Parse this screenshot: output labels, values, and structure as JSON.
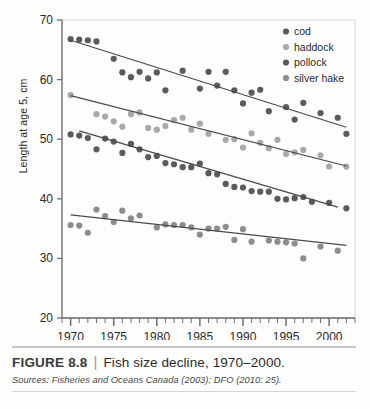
{
  "figure": {
    "number_label": "FIGURE 8.8",
    "separator": "|",
    "title": "Fish size decline, 1970–2000.",
    "sources_label": "Sources:",
    "sources_text": "Fisheries and Oceans Canada (2003); DFO (2010: 25)."
  },
  "chart_data": {
    "type": "scatter",
    "title": "Fish size decline, 1970–2000.",
    "xlabel": "",
    "ylabel": "Length at age 5, cm",
    "xlim": [
      1969,
      2003
    ],
    "ylim": [
      20,
      70
    ],
    "yticks": [
      20,
      30,
      40,
      50,
      60,
      70
    ],
    "xticks": [
      1970,
      1975,
      1980,
      1985,
      1990,
      1995,
      2000
    ],
    "xminor_step": 1,
    "grid": false,
    "legend_position": "top-right",
    "colors": {
      "cod": "#5b5b5e",
      "haddock": "#a9a9ac",
      "pollock": "#5b5b5e",
      "silver_hake": "#8d8d90",
      "trendline": "#4a4a4d",
      "axis": "#6e6e70"
    },
    "series": [
      {
        "name": "cod",
        "color": "#5b5b5e",
        "trend": {
          "x": [
            1970,
            2002
          ],
          "y": [
            66.6,
            52.0
          ]
        },
        "points": [
          {
            "x": 1970,
            "y": 66.8
          },
          {
            "x": 1971,
            "y": 66.7
          },
          {
            "x": 1972,
            "y": 66.6
          },
          {
            "x": 1973,
            "y": 66.4
          },
          {
            "x": 1975,
            "y": 63.5
          },
          {
            "x": 1976,
            "y": 61.2
          },
          {
            "x": 1977,
            "y": 60.4
          },
          {
            "x": 1978,
            "y": 61.3
          },
          {
            "x": 1979,
            "y": 60.2
          },
          {
            "x": 1980,
            "y": 61.2
          },
          {
            "x": 1981,
            "y": 58.2
          },
          {
            "x": 1983,
            "y": 61.5
          },
          {
            "x": 1985,
            "y": 58.5
          },
          {
            "x": 1986,
            "y": 61.3
          },
          {
            "x": 1987,
            "y": 59.0
          },
          {
            "x": 1988,
            "y": 61.3
          },
          {
            "x": 1989,
            "y": 58.2
          },
          {
            "x": 1990,
            "y": 56.0
          },
          {
            "x": 1991,
            "y": 57.8
          },
          {
            "x": 1992,
            "y": 58.3
          },
          {
            "x": 1993,
            "y": 54.7
          },
          {
            "x": 1995,
            "y": 55.4
          },
          {
            "x": 1996,
            "y": 53.3
          },
          {
            "x": 1997,
            "y": 56.1
          },
          {
            "x": 1999,
            "y": 54.4
          },
          {
            "x": 2001,
            "y": 53.6
          },
          {
            "x": 2002,
            "y": 50.9
          }
        ]
      },
      {
        "name": "haddock",
        "color": "#a9a9ac",
        "trend": {
          "x": [
            1970,
            2002
          ],
          "y": [
            57.3,
            45.5
          ]
        },
        "points": [
          {
            "x": 1970,
            "y": 57.4
          },
          {
            "x": 1973,
            "y": 54.2
          },
          {
            "x": 1974,
            "y": 53.8
          },
          {
            "x": 1975,
            "y": 53.0
          },
          {
            "x": 1976,
            "y": 52.1
          },
          {
            "x": 1977,
            "y": 54.2
          },
          {
            "x": 1978,
            "y": 54.5
          },
          {
            "x": 1979,
            "y": 51.9
          },
          {
            "x": 1980,
            "y": 51.6
          },
          {
            "x": 1981,
            "y": 52.2
          },
          {
            "x": 1982,
            "y": 53.2
          },
          {
            "x": 1983,
            "y": 53.6
          },
          {
            "x": 1984,
            "y": 51.6
          },
          {
            "x": 1985,
            "y": 52.6
          },
          {
            "x": 1986,
            "y": 50.9
          },
          {
            "x": 1988,
            "y": 49.9
          },
          {
            "x": 1989,
            "y": 50.0
          },
          {
            "x": 1990,
            "y": 48.6
          },
          {
            "x": 1991,
            "y": 51.0
          },
          {
            "x": 1992,
            "y": 49.4
          },
          {
            "x": 1993,
            "y": 48.5
          },
          {
            "x": 1994,
            "y": 49.9
          },
          {
            "x": 1995,
            "y": 47.5
          },
          {
            "x": 1996,
            "y": 47.8
          },
          {
            "x": 1997,
            "y": 48.2
          },
          {
            "x": 1999,
            "y": 47.3
          },
          {
            "x": 2000,
            "y": 45.4
          },
          {
            "x": 2002,
            "y": 45.4
          }
        ]
      },
      {
        "name": "pollock",
        "color": "#5b5b5e",
        "trend": {
          "x": [
            1971,
            2001
          ],
          "y": [
            51.4,
            38.6
          ]
        },
        "points": [
          {
            "x": 1970,
            "y": 50.8
          },
          {
            "x": 1971,
            "y": 50.6
          },
          {
            "x": 1972,
            "y": 50.2
          },
          {
            "x": 1973,
            "y": 48.3
          },
          {
            "x": 1974,
            "y": 50.1
          },
          {
            "x": 1975,
            "y": 49.6
          },
          {
            "x": 1976,
            "y": 47.7
          },
          {
            "x": 1977,
            "y": 49.2
          },
          {
            "x": 1978,
            "y": 48.3
          },
          {
            "x": 1979,
            "y": 47.0
          },
          {
            "x": 1980,
            "y": 47.2
          },
          {
            "x": 1981,
            "y": 46.0
          },
          {
            "x": 1982,
            "y": 45.8
          },
          {
            "x": 1983,
            "y": 45.3
          },
          {
            "x": 1984,
            "y": 45.3
          },
          {
            "x": 1985,
            "y": 45.9
          },
          {
            "x": 1986,
            "y": 44.3
          },
          {
            "x": 1987,
            "y": 44.1
          },
          {
            "x": 1988,
            "y": 42.5
          },
          {
            "x": 1989,
            "y": 42.0
          },
          {
            "x": 1990,
            "y": 41.9
          },
          {
            "x": 1991,
            "y": 41.3
          },
          {
            "x": 1992,
            "y": 41.2
          },
          {
            "x": 1993,
            "y": 41.2
          },
          {
            "x": 1994,
            "y": 40.0
          },
          {
            "x": 1995,
            "y": 39.9
          },
          {
            "x": 1996,
            "y": 40.1
          },
          {
            "x": 1997,
            "y": 40.3
          },
          {
            "x": 1998,
            "y": 39.5
          },
          {
            "x": 2000,
            "y": 39.3
          },
          {
            "x": 2002,
            "y": 38.4
          }
        ]
      },
      {
        "name": "silver hake",
        "color": "#8d8d90",
        "trend": {
          "x": [
            1970,
            2002
          ],
          "y": [
            37.3,
            32.2
          ]
        },
        "points": [
          {
            "x": 1970,
            "y": 35.6
          },
          {
            "x": 1971,
            "y": 35.5
          },
          {
            "x": 1972,
            "y": 34.3
          },
          {
            "x": 1973,
            "y": 38.2
          },
          {
            "x": 1974,
            "y": 37.1
          },
          {
            "x": 1975,
            "y": 36.1
          },
          {
            "x": 1976,
            "y": 38.0
          },
          {
            "x": 1977,
            "y": 36.7
          },
          {
            "x": 1978,
            "y": 37.2
          },
          {
            "x": 1980,
            "y": 35.2
          },
          {
            "x": 1981,
            "y": 35.7
          },
          {
            "x": 1982,
            "y": 35.6
          },
          {
            "x": 1983,
            "y": 35.6
          },
          {
            "x": 1984,
            "y": 35.2
          },
          {
            "x": 1985,
            "y": 34.0
          },
          {
            "x": 1986,
            "y": 35.0
          },
          {
            "x": 1987,
            "y": 35.0
          },
          {
            "x": 1988,
            "y": 35.3
          },
          {
            "x": 1989,
            "y": 33.1
          },
          {
            "x": 1990,
            "y": 34.9
          },
          {
            "x": 1991,
            "y": 32.8
          },
          {
            "x": 1993,
            "y": 33.0
          },
          {
            "x": 1994,
            "y": 32.8
          },
          {
            "x": 1995,
            "y": 32.7
          },
          {
            "x": 1996,
            "y": 32.5
          },
          {
            "x": 1997,
            "y": 30.0
          },
          {
            "x": 1999,
            "y": 32.0
          },
          {
            "x": 2001,
            "y": 31.3
          }
        ]
      }
    ],
    "legend": [
      {
        "label": "cod",
        "color": "#5b5b5e"
      },
      {
        "label": "haddock",
        "color": "#a9a9ac"
      },
      {
        "label": "pollock",
        "color": "#5b5b5e"
      },
      {
        "label": "silver hake",
        "color": "#8d8d90"
      }
    ]
  }
}
